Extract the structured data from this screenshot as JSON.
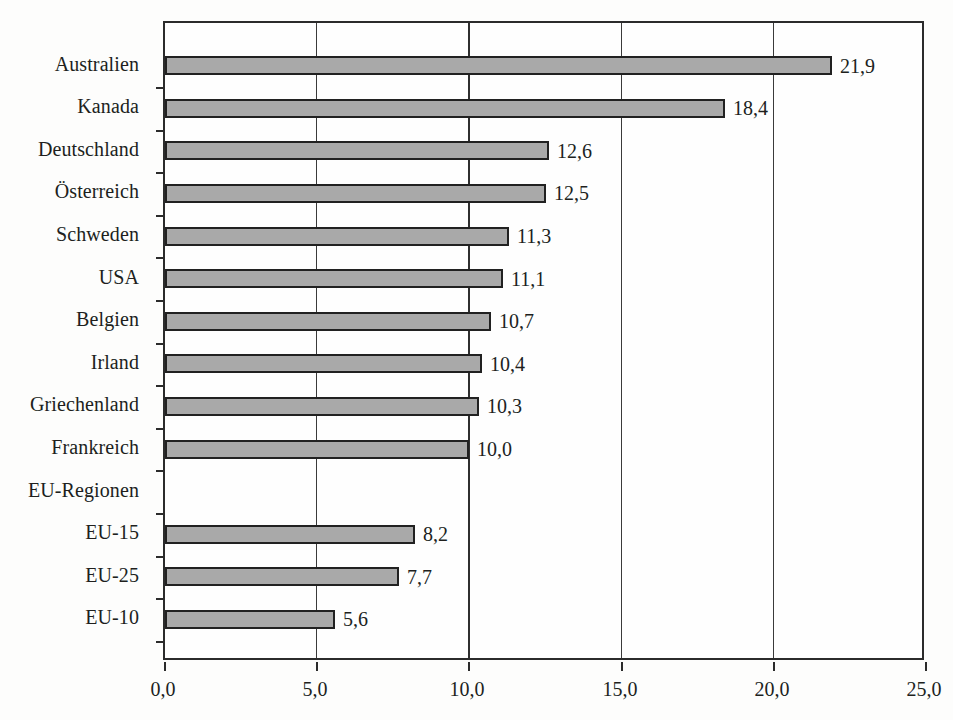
{
  "chart_data": {
    "type": "bar",
    "orientation": "horizontal",
    "title": "",
    "subtitle": "",
    "xlabel": "",
    "ylabel": "",
    "xlim": [
      0.0,
      25.0
    ],
    "xticks": [
      "0,0",
      "5,0",
      "10,0",
      "15,0",
      "20,0",
      "25,0"
    ],
    "xtick_values": [
      0.0,
      5.0,
      10.0,
      15.0,
      20.0,
      25.0
    ],
    "grid": "vertical",
    "legend": "none",
    "decimal_separator": ",",
    "categories": [
      "Australien",
      "Kanada",
      "Deutschland",
      "Österreich",
      "Schweden",
      "USA",
      "Belgien",
      "Irland",
      "Griechenland",
      "Frankreich",
      "EU-Regionen",
      "EU-15",
      "EU-25",
      "EU-10"
    ],
    "values": [
      21.9,
      18.4,
      12.6,
      12.5,
      11.3,
      11.1,
      10.7,
      10.4,
      10.3,
      10.0,
      null,
      8.2,
      7.7,
      5.6
    ],
    "value_labels": [
      "21,9",
      "18,4",
      "12,6",
      "12,5",
      "11,3",
      "11,1",
      "10,7",
      "10,4",
      "10,3",
      "10,0",
      "",
      "8,2",
      "7,7",
      "5,6"
    ],
    "bars": [
      {
        "category": "Australien",
        "value": 21.9,
        "label": "21,9"
      },
      {
        "category": "Kanada",
        "value": 18.4,
        "label": "18,4"
      },
      {
        "category": "Deutschland",
        "value": 12.6,
        "label": "12,6"
      },
      {
        "category": "Österreich",
        "value": 12.5,
        "label": "12,5"
      },
      {
        "category": "Schweden",
        "value": 11.3,
        "label": "11,3"
      },
      {
        "category": "USA",
        "value": 11.1,
        "label": "11,1"
      },
      {
        "category": "Belgien",
        "value": 10.7,
        "label": "10,7"
      },
      {
        "category": "Irland",
        "value": 10.4,
        "label": "10,4"
      },
      {
        "category": "Griechenland",
        "value": 10.3,
        "label": "10,3"
      },
      {
        "category": "Frankreich",
        "value": 10.0,
        "label": "10,0"
      },
      {
        "category": "EU-Regionen",
        "value": null,
        "label": ""
      },
      {
        "category": "EU-15",
        "value": 8.2,
        "label": "8,2"
      },
      {
        "category": "EU-25",
        "value": 7.7,
        "label": "7,7"
      },
      {
        "category": "EU-10",
        "value": 5.6,
        "label": "5,6"
      }
    ],
    "colors": {
      "bar_fill": "#a9a9a9",
      "bar_border": "#212121",
      "axis": "#2b2b2b",
      "grid": "#2f2f2f",
      "text": "#201f1d",
      "background": "#fdfdfc"
    }
  }
}
